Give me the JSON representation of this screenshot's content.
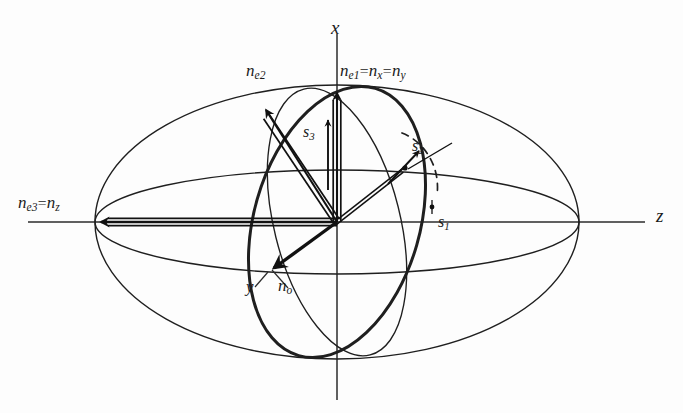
{
  "figure": {
    "kind": "index-ellipsoid-diagram",
    "background": "#fdfdfd",
    "stroke_color": "#1a1a1a",
    "center": {
      "x": 337,
      "y": 222
    }
  },
  "axes": [
    {
      "name": "x-axis",
      "label": "x",
      "label_x": 331,
      "label_y": 18,
      "orientation": "vertical"
    },
    {
      "name": "z-axis",
      "label": "z",
      "label_x": 656,
      "label_y": 206,
      "orientation": "horizontal"
    }
  ],
  "labels": {
    "ne1": {
      "n": "n",
      "sub1": "e1",
      "eq1": "=",
      "n2": "n",
      "sub2": "x",
      "eq2": "=",
      "n3": "n",
      "sub3": "y",
      "x": 340,
      "y": 62
    },
    "ne2": {
      "n": "n",
      "sub": "e2",
      "x": 246,
      "y": 62
    },
    "ne3": {
      "n": "n",
      "sub1": "e3",
      "eq": "=",
      "n2": "n",
      "sub2": "z",
      "x": 18,
      "y": 194
    },
    "no": {
      "n": "n",
      "sub": "o",
      "x": 278,
      "y": 277
    },
    "y": {
      "text": "y",
      "x": 246,
      "y": 278
    },
    "s1": {
      "n": "s",
      "sub": "1",
      "x": 438,
      "y": 214
    },
    "s2": {
      "n": "s",
      "sub": "2",
      "x": 412,
      "y": 138
    },
    "s3": {
      "n": "s",
      "sub": "3",
      "x": 305,
      "y": 124
    }
  },
  "vectors": [
    {
      "name": "ne1-vector",
      "from": "center",
      "to_x": 337,
      "to_y": 88,
      "style": "double-line-bold-arrow"
    },
    {
      "name": "ne2-vector",
      "from": "center",
      "to_x": 263,
      "to_y": 104,
      "style": "double-line-bold-arrow"
    },
    {
      "name": "ne3-vector",
      "from": "center",
      "to_x": 97,
      "to_y": 222,
      "style": "double-line-bold-arrow"
    },
    {
      "name": "no-vector",
      "from": "center",
      "to_x": 270,
      "to_y": 272,
      "style": "single-bold-arrow"
    },
    {
      "name": "s-vector",
      "from": "center",
      "to_x": 404,
      "to_y": 168,
      "style": "double-line-plain"
    },
    {
      "name": "s2-vector",
      "from_x": 385,
      "from_y": 188,
      "to_x": 417,
      "to_y": 150,
      "style": "thin-arrow"
    },
    {
      "name": "s3-vector",
      "from_x": 327,
      "from_y": 188,
      "to_x": 327,
      "to_y": 120,
      "style": "thin-arrow"
    }
  ],
  "curves": [
    {
      "name": "outer-ellipse",
      "type": "ellipse",
      "rx": 242,
      "ry": 137,
      "weight": 1.4,
      "dashed": false
    },
    {
      "name": "equatorial-ellipse",
      "type": "ellipse",
      "rx": 242,
      "ry": 52,
      "weight": 1.4,
      "dashed": false
    },
    {
      "name": "circular-section",
      "type": "ellipse-tilted",
      "weight": 1.4,
      "dashed": false
    },
    {
      "name": "wave-normal-ellipse",
      "type": "ellipse-tilted",
      "weight": 3.0,
      "dashed": false
    },
    {
      "name": "s1-projection-arc",
      "type": "arc",
      "weight": 1.6,
      "dashed": true
    }
  ]
}
